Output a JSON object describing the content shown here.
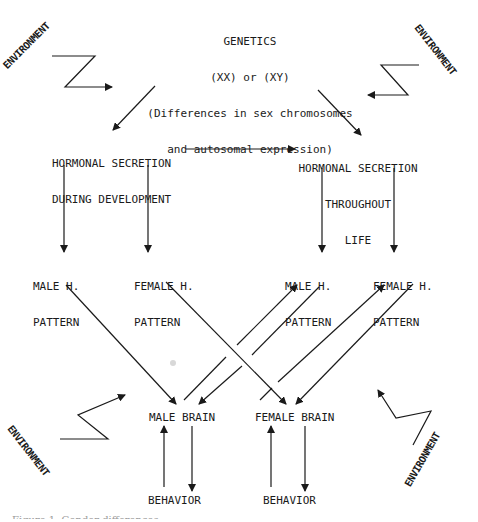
{
  "diagram": {
    "type": "flowchart",
    "nodes": {
      "genetics": {
        "title": "GENETICS",
        "line2": "(XX) or (XY)",
        "line3": "(Differences in sex chromosomes",
        "line4": "and autosomal expression)"
      },
      "hormonal_development": {
        "line1": "HORMONAL SECRETION",
        "line2": "DURING DEVELOPMENT"
      },
      "hormonal_lifelong": {
        "line1": "HORMONAL SECRETION",
        "line2": "THROUGHOUT",
        "line3": "LIFE"
      },
      "patterns": [
        {
          "line1": "MALE H.",
          "line2": "PATTERN"
        },
        {
          "line1": "FEMALE H.",
          "line2": "PATTERN"
        },
        {
          "line1": "MALE H.",
          "line2": "PATTERN"
        },
        {
          "line1": "FEMALE H.",
          "line2": "PATTERN"
        }
      ],
      "brains": [
        "MALE BRAIN",
        "FEMALE BRAIN"
      ],
      "behaviors": [
        "BEHAVIOR",
        "BEHAVIOR"
      ]
    },
    "environment_labels": [
      "ENVIRONMENT",
      "ENVIRONMENT",
      "ENVIRONMENT",
      "ENVIRONMENT"
    ],
    "edges": [
      {
        "from": "genetics",
        "to": "hormonal_development"
      },
      {
        "from": "genetics",
        "to": "hormonal_lifelong"
      },
      {
        "from": "hormonal_development",
        "to": "hormonal_lifelong"
      },
      {
        "from": "hormonal_development",
        "to": "patterns.0"
      },
      {
        "from": "hormonal_development",
        "to": "patterns.1"
      },
      {
        "from": "hormonal_lifelong",
        "to": "patterns.2"
      },
      {
        "from": "hormonal_lifelong",
        "to": "patterns.3"
      },
      {
        "from": "patterns.0",
        "to": "brains.0"
      },
      {
        "from": "patterns.1",
        "to": "brains.1"
      },
      {
        "from": "patterns.2",
        "to": "brains.0"
      },
      {
        "from": "brains.0",
        "to": "patterns.2"
      },
      {
        "from": "patterns.3",
        "to": "brains.1"
      },
      {
        "from": "brains.1",
        "to": "patterns.3"
      },
      {
        "from": "brains.0",
        "to": "behaviors.0"
      },
      {
        "from": "behaviors.0",
        "to": "brains.0"
      },
      {
        "from": "brains.1",
        "to": "behaviors.1"
      },
      {
        "from": "behaviors.1",
        "to": "brains.1"
      },
      {
        "from": "environment",
        "to": "genetics"
      }
    ],
    "caption_partial": "Figure 1.   Gender differences ..."
  },
  "colors": {
    "ink": "#1a1a1a",
    "background": "#ffffff"
  }
}
